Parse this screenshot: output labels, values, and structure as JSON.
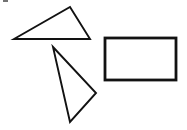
{
  "figure": {
    "background_color": "#ffffff",
    "stroke_color": "#121212",
    "width": 187,
    "height": 130
  },
  "shapes": [
    {
      "name": "triangle-top",
      "kind": "triangle",
      "points": "14,39 70,7 90,39",
      "stroke_width": 1.9,
      "label": ""
    },
    {
      "name": "triangle-lower",
      "kind": "triangle",
      "points": "53,47 96,93 70,122",
      "stroke_width": 1.9,
      "label": ""
    },
    {
      "name": "rectangle-right",
      "kind": "rectangle",
      "x": 105,
      "y": 38,
      "width": 71,
      "height": 42,
      "stroke_width": 2.8,
      "label": ""
    }
  ],
  "artifact": {
    "name": "corner-smudge",
    "color": "#5a5a5a"
  }
}
